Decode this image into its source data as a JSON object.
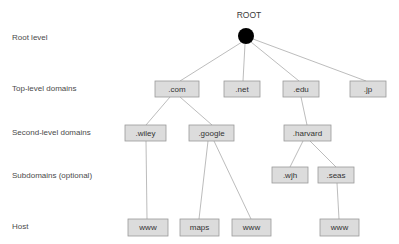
{
  "diagram": {
    "background_color": "#ffffff",
    "box_fill_color": "#dcdcdc",
    "box_stroke_color": "#9a9a9a",
    "edge_color": "#b4b4b4",
    "label_color": "#4a4a4a",
    "root_dot_color": "#000000"
  },
  "root": {
    "title": "ROOT",
    "title_x": 249,
    "title_y": 16,
    "dot_cx": 246,
    "dot_cy": 36,
    "dot_r": 8
  },
  "row_labels": [
    {
      "text": "Root level",
      "x": 12,
      "y": 38
    },
    {
      "text": "Top-level domains",
      "x": 12,
      "y": 89
    },
    {
      "text": "Second-level domains",
      "x": 12,
      "y": 133
    },
    {
      "text": "Subdomains (optional)",
      "x": 12,
      "y": 176
    },
    {
      "text": "Host",
      "x": 12,
      "y": 227
    }
  ],
  "nodes": [
    {
      "id": "com",
      "label": ".com",
      "x": 155,
      "y": 81,
      "w": 44,
      "h": 16,
      "level": "top-level"
    },
    {
      "id": "net",
      "label": ".net",
      "x": 224,
      "y": 81,
      "w": 36,
      "h": 16,
      "level": "top-level"
    },
    {
      "id": "edu",
      "label": ".edu",
      "x": 283,
      "y": 81,
      "w": 36,
      "h": 16,
      "level": "top-level"
    },
    {
      "id": "jp",
      "label": ".jp",
      "x": 350,
      "y": 81,
      "w": 36,
      "h": 16,
      "level": "top-level"
    },
    {
      "id": "wiley",
      "label": ".wiley",
      "x": 125,
      "y": 125,
      "w": 41,
      "h": 16,
      "level": "second-level"
    },
    {
      "id": "google",
      "label": ".google",
      "x": 189,
      "y": 125,
      "w": 45,
      "h": 16,
      "level": "second-level"
    },
    {
      "id": "harvard",
      "label": ".harvard",
      "x": 284,
      "y": 125,
      "w": 47,
      "h": 16,
      "level": "second-level"
    },
    {
      "id": "wjh",
      "label": ".wjh",
      "x": 272,
      "y": 167,
      "w": 36,
      "h": 16,
      "level": "subdomain"
    },
    {
      "id": "seas",
      "label": ".seas",
      "x": 318,
      "y": 167,
      "w": 36,
      "h": 16,
      "level": "subdomain"
    },
    {
      "id": "www1",
      "label": "www",
      "x": 128,
      "y": 219,
      "w": 40,
      "h": 17,
      "level": "host"
    },
    {
      "id": "maps",
      "label": "maps",
      "x": 180,
      "y": 219,
      "w": 39,
      "h": 17,
      "level": "host"
    },
    {
      "id": "www2",
      "label": "www",
      "x": 232,
      "y": 219,
      "w": 39,
      "h": 17,
      "level": "host"
    },
    {
      "id": "www3",
      "label": "www",
      "x": 320,
      "y": 219,
      "w": 39,
      "h": 17,
      "level": "host"
    }
  ],
  "edges": [
    {
      "from": "root",
      "to": "com",
      "x1": 242,
      "y1": 42,
      "x2": 180,
      "y2": 81
    },
    {
      "from": "root",
      "to": "net",
      "x1": 245,
      "y1": 44,
      "x2": 243,
      "y2": 81
    },
    {
      "from": "root",
      "to": "edu",
      "x1": 251,
      "y1": 42,
      "x2": 299,
      "y2": 81
    },
    {
      "from": "root",
      "to": "jp",
      "x1": 253,
      "y1": 39,
      "x2": 366,
      "y2": 81
    },
    {
      "from": "com",
      "to": "wiley",
      "x1": 170,
      "y1": 97,
      "x2": 146,
      "y2": 125
    },
    {
      "from": "com",
      "to": "google",
      "x1": 180,
      "y1": 97,
      "x2": 212,
      "y2": 125
    },
    {
      "from": "edu",
      "to": "harvard",
      "x1": 301,
      "y1": 97,
      "x2": 307,
      "y2": 125
    },
    {
      "from": "harvard",
      "to": "wjh",
      "x1": 303,
      "y1": 141,
      "x2": 290,
      "y2": 167
    },
    {
      "from": "harvard",
      "to": "seas",
      "x1": 310,
      "y1": 141,
      "x2": 336,
      "y2": 167
    },
    {
      "from": "wiley",
      "to": "www1",
      "x1": 146,
      "y1": 141,
      "x2": 147,
      "y2": 219
    },
    {
      "from": "google",
      "to": "maps",
      "x1": 208,
      "y1": 141,
      "x2": 199,
      "y2": 219
    },
    {
      "from": "google",
      "to": "www2",
      "x1": 214,
      "y1": 141,
      "x2": 251,
      "y2": 219
    },
    {
      "from": "seas",
      "to": "www3",
      "x1": 337,
      "y1": 183,
      "x2": 339,
      "y2": 219
    }
  ]
}
